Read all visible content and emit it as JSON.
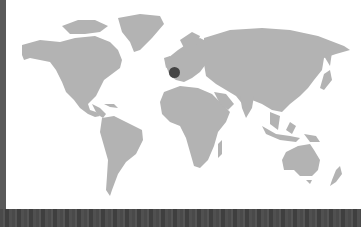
{
  "map": {
    "type": "world-map",
    "land_color": "#b3b3b3",
    "ocean_color": "#ffffff",
    "marker": {
      "label": "location-marker",
      "region": "Western Europe (France)",
      "color": "#444444",
      "x": 174,
      "y": 72
    }
  },
  "frame": {
    "left_bar_color": "#5a5a5a",
    "bottom_strip_color": "#4a4a4a"
  }
}
